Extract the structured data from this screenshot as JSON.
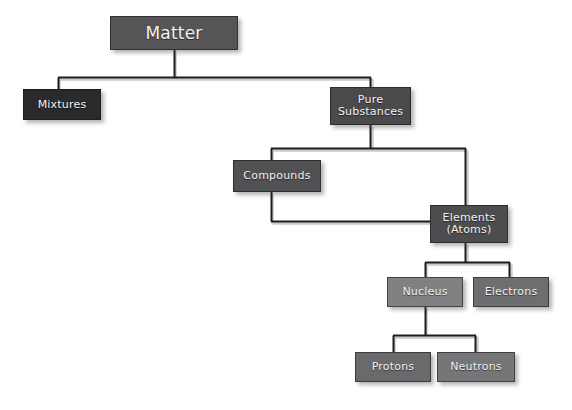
{
  "diagram": {
    "background_color": "#ffffff",
    "text_color": "#f2f2f2",
    "connector_color": "#1d1d1f",
    "connector_shadow_color": "#c9c9cb",
    "nodes": [
      {
        "id": "matter",
        "label": "Matter",
        "x": 110,
        "y": 16,
        "w": 128,
        "h": 34,
        "color": "#555558",
        "font_size": 17
      },
      {
        "id": "mixtures",
        "label": "Mixtures",
        "x": 23,
        "y": 89,
        "w": 78,
        "h": 31,
        "color": "#2a2a2c",
        "font_size": 11
      },
      {
        "id": "pure-substances",
        "label": "Pure\nSubstances",
        "x": 330,
        "y": 87,
        "w": 81,
        "h": 38,
        "color": "#4a4a4d",
        "font_size": 11
      },
      {
        "id": "compounds",
        "label": "Compounds",
        "x": 233,
        "y": 160,
        "w": 88,
        "h": 32,
        "color": "#515154",
        "font_size": 11
      },
      {
        "id": "elements-atoms",
        "label": "Elements\n(Atoms)",
        "x": 430,
        "y": 205,
        "w": 78,
        "h": 38,
        "color": "#4d4d50",
        "font_size": 11
      },
      {
        "id": "nucleus",
        "label": "Nucleus",
        "x": 387,
        "y": 277,
        "w": 76,
        "h": 30,
        "color": "#818184",
        "font_size": 11
      },
      {
        "id": "electrons",
        "label": "Electrons",
        "x": 473,
        "y": 277,
        "w": 76,
        "h": 30,
        "color": "#6e6e71",
        "font_size": 11
      },
      {
        "id": "protons",
        "label": "Protons",
        "x": 355,
        "y": 352,
        "w": 76,
        "h": 30,
        "color": "#6a6a6d",
        "font_size": 11
      },
      {
        "id": "neutrons",
        "label": "Neutrons",
        "x": 437,
        "y": 352,
        "w": 78,
        "h": 30,
        "color": "#767679",
        "font_size": 11
      }
    ],
    "edges": [
      {
        "id": "matter-to-children",
        "from": "matter",
        "to": "mixtures,pure-substances",
        "style": "elbow"
      },
      {
        "id": "pure-to-children",
        "from": "pure-substances",
        "to": "compounds,elements-atoms",
        "style": "elbow"
      },
      {
        "id": "compounds-to-elements",
        "from": "compounds",
        "to": "elements-atoms",
        "style": "elbow"
      },
      {
        "id": "elements-to-children",
        "from": "elements-atoms",
        "to": "nucleus,electrons",
        "style": "elbow"
      },
      {
        "id": "nucleus-to-children",
        "from": "nucleus",
        "to": "protons,neutrons",
        "style": "elbow"
      }
    ]
  }
}
